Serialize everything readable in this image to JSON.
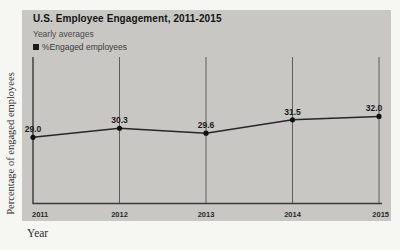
{
  "page": {
    "background_color": "#f6f6f3"
  },
  "chart_data": {
    "type": "line",
    "title": "U.S. Employee Engagement, 2011-2015",
    "subtitle": "Yearly averages",
    "legend": [
      {
        "label": "%Engaged employees",
        "swatch": "square",
        "color": "#1b1b1b"
      }
    ],
    "categories": [
      "2011",
      "2012",
      "2013",
      "2014",
      "2015"
    ],
    "series": [
      {
        "name": "%Engaged employees",
        "values": [
          29.0,
          30.3,
          29.6,
          31.5,
          32.0
        ]
      }
    ],
    "value_labels": [
      "29.0",
      "30.3",
      "29.6",
      "31.5",
      "32.0"
    ],
    "xlabel": "Year",
    "ylabel": "Percentage of engaged employees",
    "ylim": [
      19.6,
      40.5
    ],
    "grid": "vertical-gridlines-per-year",
    "legend_position": "top-left",
    "panel_color": "#c8c7c3",
    "line_color": "#262626",
    "marker_color": "#111111",
    "gridline_color": "#5d5d5a",
    "axis_color": "#3a3a38",
    "value_label_color": "#1c1c1c",
    "tick_label_color": "#2a2a28"
  }
}
